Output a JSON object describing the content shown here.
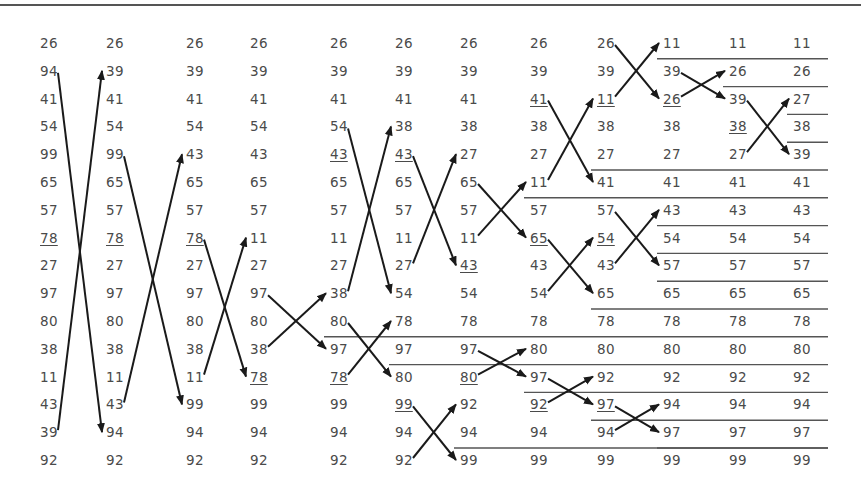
{
  "diagram": {
    "columns": [
      {
        "values": [
          "26",
          "94",
          "41",
          "54",
          "99",
          "65",
          "57",
          "78",
          "27",
          "97",
          "80",
          "38",
          "11",
          "43",
          "39",
          "92"
        ],
        "underlined": [
          7
        ]
      },
      {
        "values": [
          "26",
          "39",
          "41",
          "54",
          "99",
          "65",
          "57",
          "78",
          "27",
          "97",
          "80",
          "38",
          "11",
          "43",
          "94",
          "92"
        ],
        "underlined": [
          7
        ]
      },
      {
        "values": [
          "26",
          "39",
          "41",
          "54",
          "43",
          "65",
          "57",
          "78",
          "27",
          "97",
          "80",
          "38",
          "11",
          "99",
          "94",
          "92"
        ],
        "underlined": [
          7
        ]
      },
      {
        "values": [
          "26",
          "39",
          "41",
          "54",
          "43",
          "65",
          "57",
          "11",
          "27",
          "97",
          "80",
          "38",
          "78",
          "99",
          "94",
          "92"
        ],
        "underlined": [
          12
        ]
      },
      {
        "values": [
          "26",
          "39",
          "41",
          "54",
          "43",
          "65",
          "57",
          "11",
          "27",
          "38",
          "80",
          "97",
          "78",
          "99",
          "94",
          "92"
        ],
        "underlined": [
          4,
          12
        ]
      },
      {
        "values": [
          "26",
          "39",
          "41",
          "38",
          "43",
          "65",
          "57",
          "11",
          "27",
          "54",
          "78",
          "97",
          "80",
          "99",
          "94",
          "92"
        ],
        "underlined": [
          4,
          13
        ]
      },
      {
        "values": [
          "26",
          "39",
          "41",
          "38",
          "27",
          "65",
          "57",
          "11",
          "43",
          "54",
          "78",
          "97",
          "80",
          "92",
          "94",
          "99"
        ],
        "underlined": [
          8,
          12
        ]
      },
      {
        "values": [
          "26",
          "39",
          "41",
          "38",
          "27",
          "11",
          "57",
          "65",
          "43",
          "54",
          "78",
          "80",
          "97",
          "92",
          "94",
          "99"
        ],
        "underlined": [
          2,
          7,
          13
        ]
      },
      {
        "values": [
          "26",
          "39",
          "11",
          "38",
          "27",
          "41",
          "57",
          "54",
          "43",
          "65",
          "78",
          "80",
          "92",
          "97",
          "94",
          "99"
        ],
        "underlined": [
          2,
          7,
          13
        ]
      },
      {
        "values": [
          "11",
          "39",
          "26",
          "38",
          "27",
          "41",
          "43",
          "54",
          "57",
          "65",
          "78",
          "80",
          "92",
          "94",
          "97",
          "99"
        ],
        "underlined": [
          2
        ]
      },
      {
        "values": [
          "11",
          "26",
          "39",
          "38",
          "27",
          "41",
          "43",
          "54",
          "57",
          "65",
          "78",
          "80",
          "92",
          "94",
          "97",
          "99"
        ],
        "underlined": [
          3
        ]
      },
      {
        "values": [
          "11",
          "26",
          "27",
          "38",
          "39",
          "41",
          "43",
          "54",
          "57",
          "65",
          "78",
          "80",
          "92",
          "94",
          "97",
          "99"
        ],
        "underlined": []
      }
    ],
    "separators": [
      {
        "after_row": 10,
        "from_col": 4
      },
      {
        "after_row": 11,
        "from_col": 5
      },
      {
        "after_row": 14,
        "from_col": 6
      },
      {
        "after_row": 5,
        "from_col": 7
      },
      {
        "after_row": 12,
        "from_col": 7
      },
      {
        "after_row": 4,
        "from_col": 8
      },
      {
        "after_row": 9,
        "from_col": 8
      },
      {
        "after_row": 13,
        "from_col": 8
      },
      {
        "after_row": 0,
        "from_col": 9
      },
      {
        "after_row": 6,
        "from_col": 9
      },
      {
        "after_row": 7,
        "from_col": 9
      },
      {
        "after_row": 8,
        "from_col": 9
      },
      {
        "after_row": 14,
        "from_col": 9
      },
      {
        "after_row": 1,
        "from_col": 10
      },
      {
        "after_row": 2,
        "from_col": 11
      },
      {
        "after_row": 3,
        "from_col": 11
      }
    ],
    "swaps": [
      {
        "col": 0,
        "row_a": 1,
        "row_b": 14
      },
      {
        "col": 1,
        "row_a": 4,
        "row_b": 13
      },
      {
        "col": 2,
        "row_a": 7,
        "row_b": 12
      },
      {
        "col": 3,
        "row_a": 9,
        "row_b": 11,
        "pivot_swap": true
      },
      {
        "col": 4,
        "row_a": 3,
        "row_b": 9
      },
      {
        "col": 4,
        "row_a": 10,
        "row_b": 12
      },
      {
        "col": 5,
        "row_a": 4,
        "row_b": 8
      },
      {
        "col": 5,
        "row_a": 13,
        "row_b": 15
      },
      {
        "col": 6,
        "row_a": 5,
        "row_b": 7
      },
      {
        "col": 6,
        "row_a": 11,
        "row_b": 12
      },
      {
        "col": 7,
        "row_a": 2,
        "row_b": 5
      },
      {
        "col": 7,
        "row_a": 7,
        "row_b": 9
      },
      {
        "col": 7,
        "row_a": 12,
        "row_b": 13
      },
      {
        "col": 8,
        "row_a": 0,
        "row_b": 2
      },
      {
        "col": 8,
        "row_a": 6,
        "row_b": 8
      },
      {
        "col": 8,
        "row_a": 13,
        "row_b": 14
      },
      {
        "col": 9,
        "row_a": 1,
        "row_b": 2
      },
      {
        "col": 10,
        "row_a": 2,
        "row_b": 4
      }
    ]
  }
}
